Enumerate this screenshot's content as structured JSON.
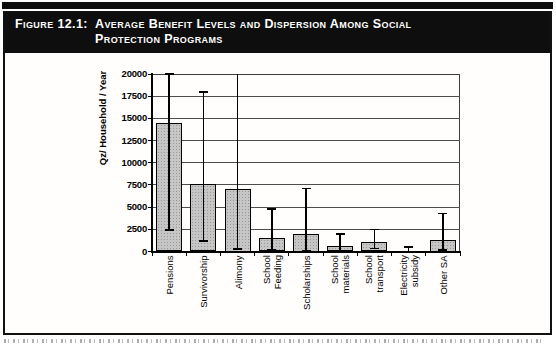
{
  "header": {
    "figure_label": "Figure 12.1:",
    "figure_title_line1": "Average Benefit Levels and Dispersion Among Social",
    "figure_title_line2": "Protection Programs"
  },
  "chart_data": {
    "type": "bar",
    "title": "Figure 12.1: Average Benefit Levels and Dispersion Among Social Protection Programs",
    "xlabel": "",
    "ylabel": "Qz/ Household / Year",
    "ylim": [
      0,
      20000
    ],
    "yticks": [
      0,
      2500,
      5000,
      7500,
      10000,
      12500,
      15000,
      17500,
      20000
    ],
    "grid": true,
    "legend": "none",
    "categories": [
      "Pensions",
      "Survivorship",
      "Alimony",
      "School\nFeeding",
      "Scholarships",
      "School\nmaterials",
      "School\ntransport",
      "Electricity\nsubsidy",
      "Other SA"
    ],
    "values": [
      14500,
      7600,
      7100,
      1500,
      2000,
      600,
      1100,
      100,
      1300
    ],
    "error_low": [
      2400,
      1200,
      300,
      150,
      100,
      100,
      350,
      0,
      200
    ],
    "error_high": [
      20000,
      18000,
      20000,
      4800,
      7100,
      2000,
      2500,
      500,
      4300
    ],
    "error_high_extends_beyond_axis": [
      false,
      false,
      true,
      false,
      false,
      false,
      false,
      false,
      false
    ],
    "bar_fill": "#c6c6c6",
    "bar_border": "#000000",
    "grid_color": "#4d4d4d"
  }
}
